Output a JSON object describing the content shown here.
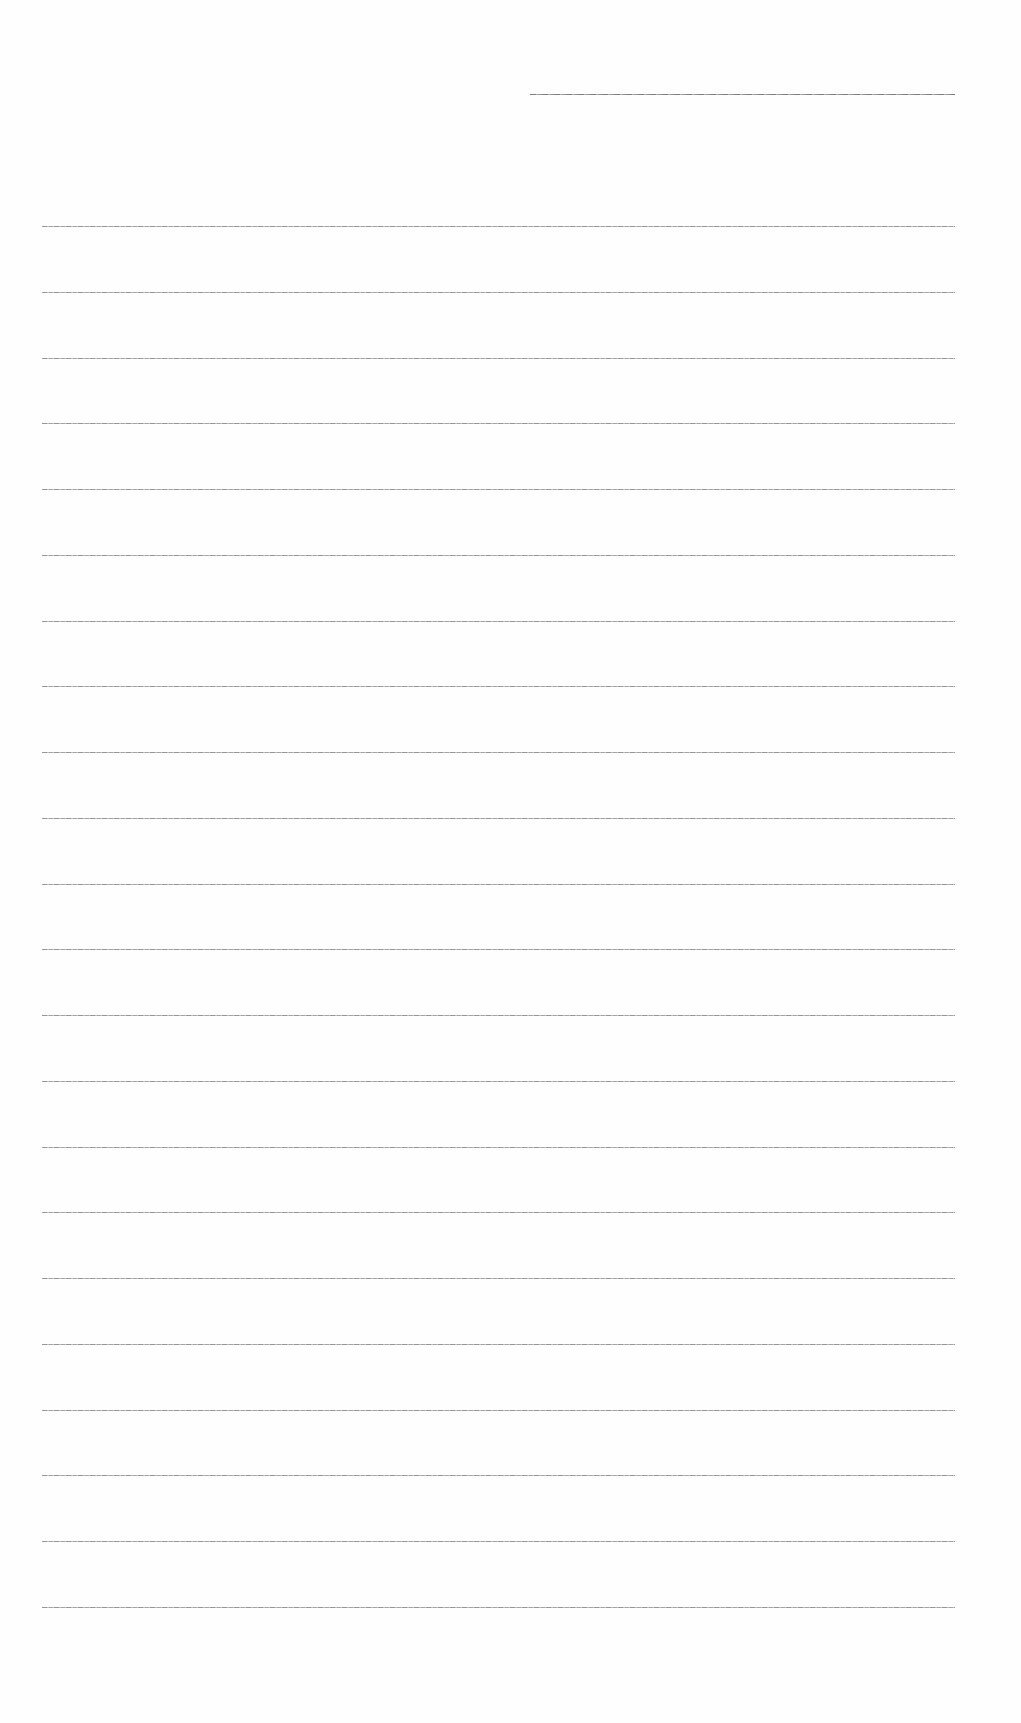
{
  "document": {
    "type": "lined-paper",
    "background_color": "#fefefe",
    "line_color": "#999999",
    "header_line": {
      "left": 530,
      "top": 94,
      "width": 425
    },
    "lines": {
      "count": 22,
      "left": 42,
      "width": 913,
      "first_top": 226,
      "spacing": 65.76
    }
  }
}
